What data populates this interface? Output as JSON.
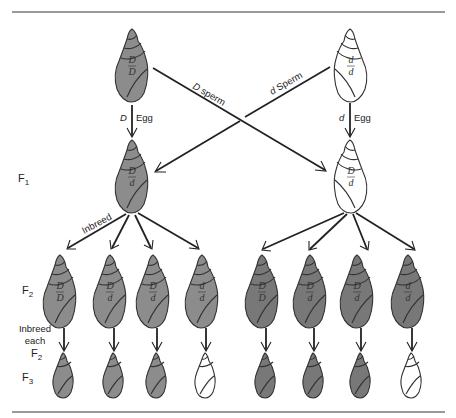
{
  "colors": {
    "dextral_fill": "#8c8c8c",
    "dextral_fill_dark": "#787878",
    "sinistral_fill": "#ffffff",
    "outline": "#333333",
    "rule": "#777777"
  },
  "generation_labels": {
    "f1": {
      "main": "F",
      "sub": "1"
    },
    "f2": {
      "main": "F",
      "sub": "2"
    },
    "f3": {
      "main": "F",
      "sub": "3"
    }
  },
  "parents": {
    "left": {
      "genotype_top": "D",
      "genotype_bottom": "D",
      "phenotype": "dextral"
    },
    "right": {
      "genotype_top": "d",
      "genotype_bottom": "d",
      "phenotype": "sinistral"
    }
  },
  "cross_labels": {
    "left_egg_allele": "D",
    "left_egg_word": "Egg",
    "right_egg_allele": "d",
    "right_egg_word": "Egg",
    "d_big_sperm_allele": "D",
    "d_big_sperm_word": "sperm",
    "d_small_sperm_allele": "d",
    "d_small_sperm_word": "Sperm"
  },
  "f1": {
    "left": {
      "genotype_top": "D",
      "genotype_bottom": "d",
      "phenotype": "dextral"
    },
    "right": {
      "genotype_top": "D",
      "genotype_bottom": "d",
      "phenotype": "sinistral"
    }
  },
  "inbreed_label": "Inbreed",
  "inbreed_each_label": {
    "line1": "Inbreed",
    "line2": "each",
    "line3_main": "F",
    "line3_sub": "2"
  },
  "f2": {
    "left": [
      {
        "genotype_top": "D",
        "genotype_bottom": "D",
        "phenotype": "dextral"
      },
      {
        "genotype_top": "D",
        "genotype_bottom": "d",
        "phenotype": "dextral"
      },
      {
        "genotype_top": "D",
        "genotype_bottom": "d",
        "phenotype": "dextral"
      },
      {
        "genotype_top": "d",
        "genotype_bottom": "d",
        "phenotype": "dextral"
      }
    ],
    "right": [
      {
        "genotype_top": "D",
        "genotype_bottom": "D",
        "phenotype": "dextral"
      },
      {
        "genotype_top": "D",
        "genotype_bottom": "d",
        "phenotype": "dextral"
      },
      {
        "genotype_top": "D",
        "genotype_bottom": "d",
        "phenotype": "dextral"
      },
      {
        "genotype_top": "d",
        "genotype_bottom": "d",
        "phenotype": "dextral"
      }
    ]
  },
  "f3": {
    "left": [
      "dextral",
      "dextral",
      "dextral",
      "sinistral"
    ],
    "right": [
      "dextral",
      "dextral",
      "dextral",
      "sinistral"
    ]
  }
}
